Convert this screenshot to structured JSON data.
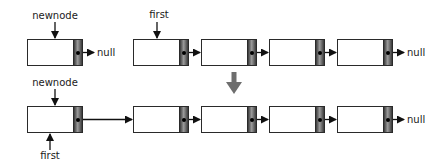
{
  "diagram": {
    "before": {
      "newnode_label": "newnode",
      "newnode_null": "null",
      "first_label": "first",
      "list_null": "null",
      "list_length": 4
    },
    "transition_arrow_color": "#6e6e6e",
    "after": {
      "newnode_label": "newnode",
      "first_label": "first",
      "list_null": "null",
      "list_length": 5
    },
    "colors": {
      "stroke": "#2a2a2a",
      "pointer_dark": "#3a3a3a",
      "pointer_light": "#9a9a9a",
      "text": "#1a1a1a",
      "background": "#ffffff"
    }
  }
}
